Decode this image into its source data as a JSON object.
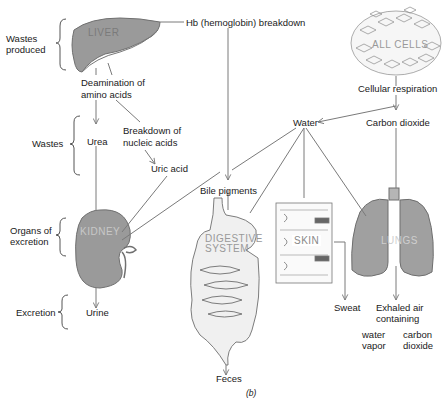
{
  "diagram": {
    "figure_label": "(b)",
    "brackets": {
      "wastes_produced": "Wastes produced",
      "wastes": "Wastes",
      "organs_of_excretion": "Organs of excretion",
      "excretion": "Excretion"
    },
    "organs": {
      "liver": "LIVER",
      "all_cells": "ALL CELLS",
      "kidney": "KIDNEY",
      "digestive_line1": "DIGESTIVE",
      "digestive_line2": "SYSTEM",
      "skin": "SKIN",
      "lungs": "LUNGS"
    },
    "nodes": {
      "hb_breakdown": "Hb (hemoglobin) breakdown",
      "deamination_line1": "Deamination of",
      "deamination_line2": "amino acids",
      "cellular_respiration": "Cellular respiration",
      "water": "Water",
      "carbon_dioxide": "Carbon dioxide",
      "urea": "Urea",
      "breakdown_line1": "Breakdown of",
      "breakdown_line2": "nucleic acids",
      "uric_acid": "Uric acid",
      "bile_pigments": "Bile pigments",
      "urine": "Urine",
      "feces": "Feces",
      "sweat": "Sweat",
      "exhaled_line1": "Exhaled air",
      "exhaled_line2": "containing",
      "water_vapor_line1": "water",
      "water_vapor_line2": "vapor",
      "co2_line1": "carbon",
      "co2_line2": "dioxide"
    },
    "colors": {
      "organ_fill": "#9a9a9a",
      "organ_stroke": "#6e6e6e",
      "line": "#7a7a7a",
      "text": "#1a1a1a"
    }
  }
}
